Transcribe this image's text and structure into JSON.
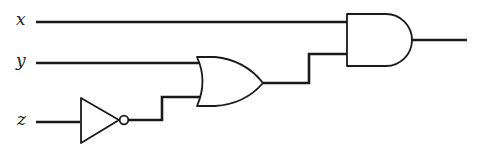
{
  "diagram": {
    "type": "logic-circuit",
    "inputs": [
      {
        "label": "x"
      },
      {
        "label": "y"
      },
      {
        "label": "z"
      }
    ],
    "gates": [
      {
        "type": "NOT",
        "inputs": [
          "z"
        ]
      },
      {
        "type": "OR",
        "inputs": [
          "y",
          "NOT z"
        ]
      },
      {
        "type": "AND",
        "inputs": [
          "x",
          "y OR NOT z"
        ]
      }
    ],
    "colors": {
      "stroke": "#1a1a1a",
      "background": "#ffffff"
    }
  }
}
